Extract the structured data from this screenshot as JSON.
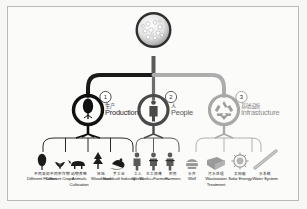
{
  "diagram": {
    "title_cn": "",
    "root": {
      "name": "village-cluster",
      "label": ""
    },
    "colors": {
      "branch1": "#1a1a1a",
      "branch2": "#6e6e6e",
      "branch3": "#adadad",
      "frame": "#b9b9b9",
      "background": "#f7f7f6",
      "text": "#2b2b2b"
    },
    "nodes": [
      {
        "number": "1",
        "cn": "生产",
        "en": "Production",
        "icon": "tree-icon",
        "color": "#1a1a1a"
      },
      {
        "number": "2",
        "cn": "人",
        "en": "People",
        "icon": "person-icon",
        "color": "#6e6e6e"
      },
      {
        "number": "3",
        "cn": "基础设施",
        "en": "Infrastucture",
        "icon": "recycle-icon",
        "color": "#adadad"
      }
    ],
    "leaves": [
      {
        "group": 1,
        "icon": "tree-icon",
        "cn": "不同果树",
        "en": "Different Fruiters"
      },
      {
        "group": 1,
        "icon": "crop-icon",
        "cn": "不同农作物",
        "en": "Different Crops."
      },
      {
        "group": 1,
        "icon": "animal-icon",
        "cn": "动物养殖",
        "en": "Animals Cultivation"
      },
      {
        "group": 1,
        "icon": "woodland-icon",
        "cn": "林地",
        "en": "Wood-land"
      },
      {
        "group": 1,
        "icon": "handicraft-icon",
        "cn": "手工业",
        "en": "Handicaft Industry"
      },
      {
        "group": 2,
        "icon": "worker-icon",
        "cn": "工人",
        "en": "Works"
      },
      {
        "group": 2,
        "icon": "carpenter-icon",
        "cn": "木工师傅",
        "en": "Works+Farmers"
      },
      {
        "group": 2,
        "icon": "farmer-icon",
        "cn": "农民",
        "en": "Farmers"
      },
      {
        "group": 2,
        "icon": "well-icon",
        "cn": "水井",
        "en": "Well"
      },
      {
        "group": 3,
        "icon": "wastewater-icon",
        "cn": "污水处理",
        "en": "Wastewater Treatment"
      },
      {
        "group": 3,
        "icon": "solar-icon",
        "cn": "太阳能",
        "en": "Solar Energy"
      },
      {
        "group": 3,
        "icon": "waterpipe-icon",
        "cn": "水系统",
        "en": "Water System"
      }
    ]
  }
}
